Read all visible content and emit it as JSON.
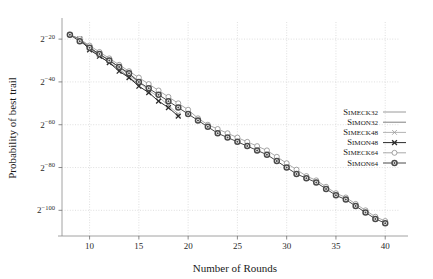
{
  "chart_data": {
    "type": "line",
    "title": "",
    "xlabel": "Number of Rounds",
    "ylabel": "Probability of best trail",
    "xlim": [
      7.2,
      41.5
    ],
    "ylim": [
      -112,
      -12
    ],
    "xticks": [
      10,
      15,
      20,
      25,
      30,
      35,
      40
    ],
    "xtick_labels": [
      "10",
      "15",
      "20",
      "25",
      "30",
      "35",
      "40"
    ],
    "yticks": [
      -20,
      -40,
      -60,
      -80,
      -100
    ],
    "ytick_labels": [
      "2−20",
      "2−40",
      "2−60",
      "2−80",
      "2−100"
    ],
    "ytick_base": "2",
    "ytick_exponents": [
      "−20",
      "−40",
      "−60",
      "−80",
      "−100"
    ],
    "grid": true,
    "grid_style": "dotted",
    "legend_position": "right-middle",
    "series": [
      {
        "name": "Simeck32",
        "marker": "none",
        "color": "#7a7a7a",
        "x": [
          8,
          9,
          10,
          11,
          12,
          13,
          14,
          15
        ],
        "y": [
          -18,
          -20,
          -24,
          -27,
          -30,
          -33,
          -36,
          -40
        ]
      },
      {
        "name": "Simon32",
        "marker": "none",
        "color": "#555555",
        "x": [
          8,
          9,
          10,
          11,
          12,
          13,
          14,
          15
        ],
        "y": [
          -18,
          -20,
          -24,
          -28,
          -31,
          -34,
          -38,
          -41
        ]
      },
      {
        "name": "Simeck48",
        "marker": "x-light",
        "color": "#9a9a9a",
        "x": [
          9,
          10,
          11,
          12,
          13,
          14,
          15,
          16,
          17,
          18,
          19
        ],
        "y": [
          -20,
          -24,
          -27,
          -30,
          -33,
          -37,
          -40,
          -44,
          -47,
          -51,
          -55
        ]
      },
      {
        "name": "Simon48",
        "marker": "x-bold",
        "color": "#2b2b2b",
        "x": [
          9,
          10,
          11,
          12,
          13,
          14,
          15,
          16,
          17,
          18,
          19
        ],
        "y": [
          -20,
          -25,
          -28,
          -31,
          -35,
          -38,
          -42,
          -45,
          -49,
          -52,
          -56
        ]
      },
      {
        "name": "Simeck64",
        "marker": "circle-open",
        "color": "#8d8d8d",
        "x": [
          8,
          9,
          10,
          11,
          12,
          13,
          14,
          15,
          16,
          17,
          18,
          19,
          20,
          21,
          22,
          23,
          24,
          25,
          26,
          27,
          28,
          29,
          30,
          31,
          32,
          33,
          34,
          35,
          36,
          37,
          38,
          39,
          40
        ],
        "y": [
          -18,
          -20,
          -23,
          -26,
          -29,
          -32,
          -35,
          -38,
          -41,
          -44,
          -47,
          -50,
          -53,
          -57,
          -60,
          -62,
          -64,
          -66,
          -68,
          -70,
          -72,
          -75,
          -78,
          -81,
          -84,
          -86,
          -89,
          -92,
          -94,
          -97,
          -100,
          -103,
          -105
        ]
      },
      {
        "name": "Simon64",
        "marker": "circle-filled",
        "color": "#4a4a4a",
        "x": [
          8,
          9,
          10,
          11,
          12,
          13,
          14,
          15,
          16,
          17,
          18,
          19,
          20,
          21,
          22,
          23,
          24,
          25,
          26,
          27,
          28,
          29,
          30,
          31,
          32,
          33,
          34,
          35,
          36,
          37,
          38,
          39,
          40
        ],
        "y": [
          -18,
          -21,
          -24,
          -27,
          -30,
          -33,
          -36,
          -40,
          -43,
          -46,
          -49,
          -52,
          -55,
          -58,
          -61,
          -64,
          -66,
          -68,
          -70,
          -72,
          -74,
          -77,
          -80,
          -83,
          -85,
          -87,
          -90,
          -93,
          -95,
          -98,
          -101,
          -104,
          -106
        ]
      }
    ],
    "legend_entries": [
      {
        "label": "Simeck32",
        "head": "S",
        "rest": "imeck32"
      },
      {
        "label": "Simon32",
        "head": "S",
        "rest": "imon32"
      },
      {
        "label": "Simeck48",
        "head": "S",
        "rest": "imeck48"
      },
      {
        "label": "Simon48",
        "head": "S",
        "rest": "imon48"
      },
      {
        "label": "Simeck64",
        "head": "S",
        "rest": "imeck64"
      },
      {
        "label": "Simon64",
        "head": "S",
        "rest": "imon64"
      }
    ]
  }
}
